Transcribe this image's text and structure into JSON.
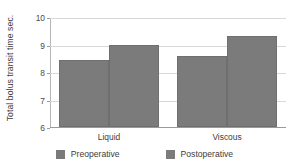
{
  "chart_data": {
    "type": "bar",
    "title": "",
    "xlabel": "",
    "ylabel": "Total bolus transit time sec.",
    "categories": [
      "Liquid",
      "Viscous"
    ],
    "series": [
      {
        "name": "Preoperative",
        "values": [
          8.45,
          8.6
        ],
        "color": "#7b7b7b"
      },
      {
        "name": "Postoperative",
        "values": [
          9.0,
          9.3
        ],
        "color": "#7b7b7b"
      }
    ],
    "ylim": [
      6,
      10
    ],
    "yticks": [
      6,
      7,
      8,
      9,
      10
    ],
    "ytick_labels": [
      "6",
      "7",
      "8",
      "9",
      "10"
    ],
    "grid": true,
    "legend_position": "bottom"
  },
  "axis": {
    "y_title": "Total bolus transit time sec.",
    "ticks": [
      {
        "value": 10,
        "label": "10"
      },
      {
        "value": 9,
        "label": "9"
      },
      {
        "value": 8,
        "label": "8"
      },
      {
        "value": 7,
        "label": "7"
      },
      {
        "value": 6,
        "label": "6"
      }
    ]
  },
  "categories": [
    {
      "label": "Liquid"
    },
    {
      "label": "Viscous"
    }
  ],
  "legend": {
    "items": [
      {
        "label": "Preoperative",
        "color": "#7b7b7b"
      },
      {
        "label": "Postoperative",
        "color": "#7b7b7b"
      }
    ]
  },
  "bars": [
    {
      "group": "Liquid",
      "series": "Preoperative",
      "value": 8.45
    },
    {
      "group": "Liquid",
      "series": "Postoperative",
      "value": 9.0
    },
    {
      "group": "Viscous",
      "series": "Preoperative",
      "value": 8.6
    },
    {
      "group": "Viscous",
      "series": "Postoperative",
      "value": 9.3
    }
  ]
}
